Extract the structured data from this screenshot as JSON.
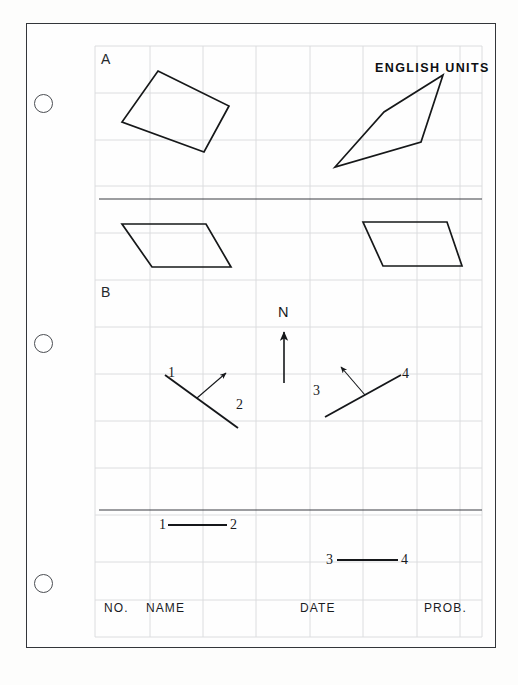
{
  "sheet": {
    "background_color": "#fdfdfc",
    "border_color": "#33363a",
    "grid_color": "#d8d9dc",
    "ink_color": "#1a1c1f"
  },
  "punch_holes": [
    {
      "name": "punch-hole-top",
      "cx": 43,
      "cy": 103
    },
    {
      "name": "punch-hole-middle",
      "cx": 43,
      "cy": 343
    },
    {
      "name": "punch-hole-bottom",
      "cx": 43,
      "cy": 583
    }
  ],
  "grid": {
    "left": 95,
    "top": 46,
    "right": 482,
    "bottom": 637,
    "x_lines": [
      95,
      150,
      203,
      256,
      310,
      363,
      417,
      460,
      482
    ],
    "y_lines": [
      46,
      93,
      140,
      186,
      233,
      280,
      327,
      374,
      421,
      468,
      515,
      562,
      600,
      637
    ]
  },
  "sections": {
    "a_label": "A",
    "b_label": "B"
  },
  "header": {
    "units_title": "ENGLISH UNITS"
  },
  "compass": {
    "north_label": "N"
  },
  "problem_a": {
    "description": "Four parallelogram / quadrilateral outlines for plotting in English units",
    "shapes": [
      {
        "name": "quad-upper-left",
        "points": "158,71 229,106 204,152 122,122"
      },
      {
        "name": "quad-upper-right",
        "points": "443,75 384,112 335,167 421,142"
      },
      {
        "name": "parallelogram-lower-left",
        "points": "122,224 206,224 231,267 152,267"
      },
      {
        "name": "parallelogram-lower-right",
        "points": "363,222 447,222 462,266 383,266"
      }
    ],
    "fold_line": {
      "name": "fold-line-a",
      "x1": 99,
      "y1": 199,
      "x2": 482,
      "y2": 199
    }
  },
  "problem_b": {
    "bearing_left": {
      "name": "bearing-line-1-2",
      "line": {
        "x1": 165,
        "y1": 375,
        "x2": 238,
        "y2": 428
      },
      "arrow": {
        "x1": 197,
        "y1": 398,
        "x2": 226,
        "y2": 374
      },
      "label_start": "1",
      "label_end": "2"
    },
    "bearing_right": {
      "name": "bearing-line-3-4",
      "line": {
        "x1": 325,
        "y1": 417,
        "x2": 401,
        "y2": 375
      },
      "arrow": {
        "x1": 365,
        "y1": 395,
        "x2": 340,
        "y2": 366
      },
      "label_start": "3",
      "label_end": "4"
    },
    "segment_1_2": {
      "name": "segment-1-2",
      "line": {
        "x1": 168,
        "y1": 525,
        "x2": 227,
        "y2": 525
      },
      "label_start": "1",
      "label_end": "2"
    },
    "segment_3_4": {
      "name": "segment-3-4",
      "line": {
        "x1": 337,
        "y1": 560,
        "x2": 398,
        "y2": 560
      },
      "label_start": "3",
      "label_end": "4"
    },
    "fold_line": {
      "name": "fold-line-b",
      "x1": 99,
      "y1": 510,
      "x2": 482,
      "y2": 510
    }
  },
  "title_block": {
    "fields": [
      {
        "name": "field-no",
        "label": "NO.",
        "x": 104
      },
      {
        "name": "field-name",
        "label": "NAME",
        "x": 146
      },
      {
        "name": "field-date",
        "label": "DATE",
        "x": 300
      },
      {
        "name": "field-prob",
        "label": "PROB.",
        "x": 424
      }
    ]
  }
}
